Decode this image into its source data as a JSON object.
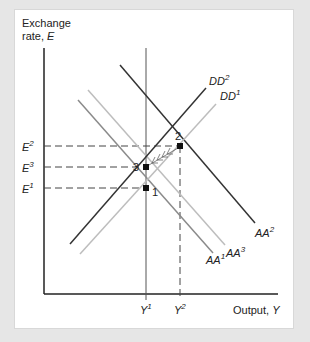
{
  "axes": {
    "y_label_line1": "Exchange",
    "y_label_line2": "rate, ",
    "y_label_var": "E",
    "x_label": "Output, ",
    "x_label_var": "Y"
  },
  "y_ticks": [
    {
      "base": "E",
      "sup": "2"
    },
    {
      "base": "E",
      "sup": "3"
    },
    {
      "base": "E",
      "sup": "1"
    }
  ],
  "x_ticks": [
    {
      "base": "Y",
      "sup": "1"
    },
    {
      "base": "Y",
      "sup": "2"
    }
  ],
  "curves": {
    "dd2": {
      "base": "DD",
      "sup": "2"
    },
    "dd1": {
      "base": "DD",
      "sup": "1"
    },
    "aa2": {
      "base": "AA",
      "sup": "2"
    },
    "aa1": {
      "base": "AA",
      "sup": "1"
    },
    "aa3": {
      "base": "AA",
      "sup": "3"
    }
  },
  "points": {
    "p1": "1",
    "p2": "2",
    "p3": "3"
  },
  "colors": {
    "dark": "#333333",
    "mid": "#8a8a8a",
    "light": "#bdbdbd"
  }
}
